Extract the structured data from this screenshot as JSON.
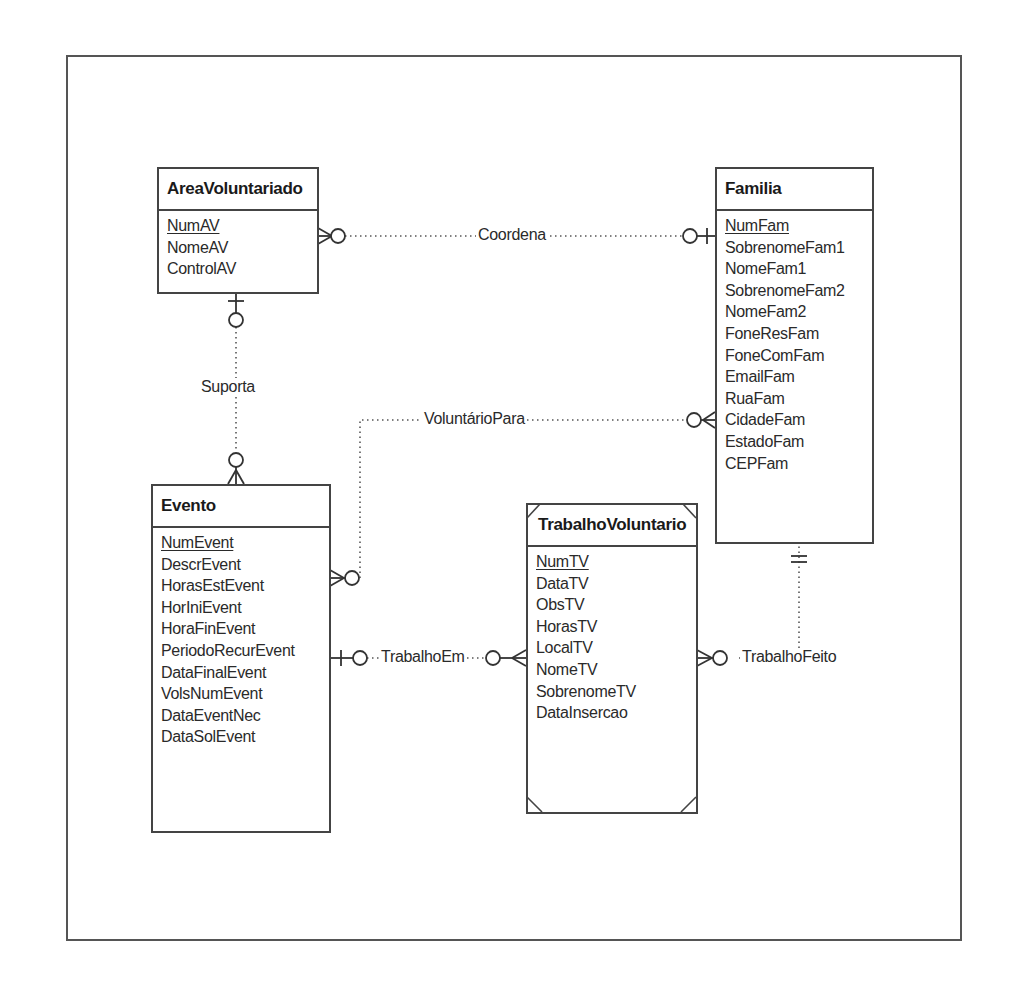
{
  "diagram": {
    "type": "entity-relationship",
    "notation": "crow's foot",
    "entities": [
      {
        "name": "AreaVoluntariado",
        "primary_key": "NumAV",
        "attributes": [
          "NumAV",
          "NomeAV",
          "ControlAV"
        ]
      },
      {
        "name": "Familia",
        "primary_key": "NumFam",
        "attributes": [
          "NumFam",
          "SobrenomeFam1",
          "NomeFam1",
          "SobrenomeFam2",
          "NomeFam2",
          "FoneResFam",
          "FoneComFam",
          "EmailFam",
          "RuaFam",
          "CidadeFam",
          "EstadoFam",
          "CEPFam"
        ]
      },
      {
        "name": "Evento",
        "primary_key": "NumEvent",
        "attributes": [
          "NumEvent",
          "DescrEvent",
          "HorasEstEvent",
          "HorIniEvent",
          "HoraFinEvent",
          "PeriodoRecurEvent",
          "DataFinalEvent",
          "VolsNumEvent",
          "DataEventNec",
          "DataSolEvent"
        ]
      },
      {
        "name": "TrabalhoVoluntario",
        "primary_key": "NumTV",
        "weak_entity": true,
        "attributes": [
          "NumTV",
          "DataTV",
          "ObsTV",
          "HorasTV",
          "LocalTV",
          "NomeTV",
          "SobrenomeTV",
          "DataInsercao"
        ]
      }
    ],
    "relationships": [
      {
        "name": "Coordena",
        "from": "Familia",
        "from_cardinality": "zero-or-one",
        "to": "AreaVoluntariado",
        "to_cardinality": "zero-or-many"
      },
      {
        "name": "Suporta",
        "from": "AreaVoluntariado",
        "from_cardinality": "zero-or-one",
        "to": "Evento",
        "to_cardinality": "zero-or-many"
      },
      {
        "name": "VoluntárioPara",
        "from": "Familia",
        "from_cardinality": "zero-or-many",
        "to": "Evento",
        "to_cardinality": "zero-or-many"
      },
      {
        "name": "TrabalhoEm",
        "from": "Evento",
        "from_cardinality": "zero-or-one",
        "to": "TrabalhoVoluntario",
        "to_cardinality": "zero-or-many"
      },
      {
        "name": "TrabalhoFeito",
        "from": "Familia",
        "from_cardinality": "exactly-one",
        "to": "TrabalhoVoluntario",
        "to_cardinality": "zero-or-many"
      }
    ]
  },
  "colors": {
    "line": "#444444",
    "text": "#222222",
    "background": "#ffffff"
  }
}
